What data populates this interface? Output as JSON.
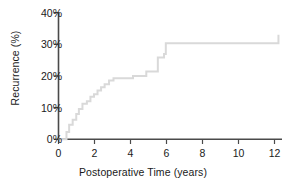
{
  "chart_data": {
    "type": "line",
    "subtype": "kaplan-meier-step",
    "title": "",
    "xlabel": "Postoperative Time (years)",
    "ylabel": "Recurrence (%)",
    "xlim": [
      0,
      12.6
    ],
    "ylim": [
      0,
      40
    ],
    "xticks": [
      0,
      2,
      4,
      6,
      8,
      10,
      12
    ],
    "xtick_labels": [
      "0",
      "2",
      "4",
      "6",
      "8",
      "10",
      "12"
    ],
    "yticks": [
      0,
      10,
      20,
      30,
      40
    ],
    "ytick_labels": [
      "0%",
      "10%",
      "20%",
      "30%",
      "40%"
    ],
    "grid": false,
    "legend": "none",
    "series": [
      {
        "name": "Cumulative recurrence",
        "color": "#d9d9d9",
        "line_width": 2,
        "step": "post",
        "x": [
          0.0,
          0.3,
          0.45,
          0.6,
          0.8,
          1.0,
          1.15,
          1.35,
          1.6,
          1.8,
          2.0,
          2.2,
          2.4,
          2.6,
          2.85,
          3.1,
          3.9,
          4.2,
          4.95,
          5.6,
          5.95,
          6.05,
          8.7,
          12.4
        ],
        "y": [
          0.0,
          0.0,
          2.3,
          4.6,
          6.2,
          8.0,
          9.6,
          11.2,
          12.0,
          13.4,
          14.2,
          15.4,
          16.4,
          17.4,
          18.6,
          19.3,
          19.3,
          20.0,
          21.4,
          25.8,
          26.9,
          30.3,
          30.3,
          33.0
        ]
      }
    ],
    "final_value": 33.0,
    "plateau_start_x": 8.7
  },
  "axes": {
    "axis_color": "#4a4a4a",
    "tick_color": "#4a4a4a",
    "text_color": "#1a1a1a",
    "spines": [
      "left",
      "bottom"
    ]
  }
}
